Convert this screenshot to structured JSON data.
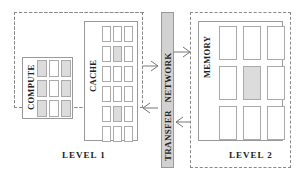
{
  "diagram": {
    "level1": {
      "label": "LEVEL 1",
      "compute": {
        "label": "COMPUTE",
        "rows": 3,
        "cols": 3,
        "shaded": [
          [
            true,
            false,
            true
          ],
          [
            true,
            false,
            true
          ],
          [
            true,
            false,
            true
          ]
        ]
      },
      "cache": {
        "label": "CACHE",
        "rows": 6,
        "cols": 3,
        "shaded": [
          [
            false,
            false,
            false
          ],
          [
            false,
            true,
            false
          ],
          [
            false,
            false,
            false
          ],
          [
            false,
            false,
            false
          ],
          [
            false,
            true,
            false
          ],
          [
            false,
            false,
            false
          ]
        ]
      }
    },
    "network": {
      "label": "TRANSFER   NETWORK"
    },
    "level2": {
      "label": "LEVEL 2",
      "memory": {
        "label": "MEMORY",
        "rows": 3,
        "cols": 3,
        "shaded": [
          [
            false,
            false,
            false
          ],
          [
            false,
            true,
            false
          ],
          [
            false,
            false,
            false
          ]
        ]
      }
    },
    "arrows": [
      {
        "from": "level1",
        "to": "network",
        "direction": "right",
        "y": 66
      },
      {
        "from": "network",
        "to": "level2",
        "direction": "right",
        "y": 52
      },
      {
        "from": "network",
        "to": "level1",
        "direction": "left",
        "y": 108
      },
      {
        "from": "level2",
        "to": "network",
        "direction": "left",
        "y": 122
      }
    ],
    "colors": {
      "shade": "#dcdcdc",
      "network": "#d2d2d2",
      "border": "#999999"
    }
  }
}
